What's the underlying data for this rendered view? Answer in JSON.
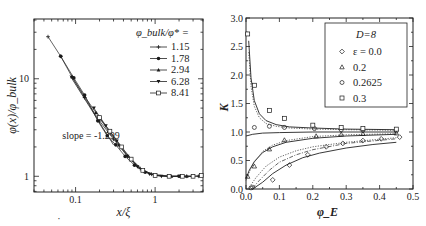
{
  "figure": {
    "background": "#ffffff",
    "ink": "#222222"
  },
  "chart_data": [
    {
      "id": "left",
      "type": "scatter",
      "scale": "log-log",
      "title": "",
      "xlabel": "x/ξ",
      "ylabel": "φ(x)/φ_bulk",
      "xlim": [
        0.03,
        4.0
      ],
      "ylim": [
        0.69,
        41
      ],
      "x_ticks": [
        {
          "value": 0.1,
          "label": "0.1"
        },
        {
          "value": 1,
          "label": "1"
        }
      ],
      "y_ticks": [
        {
          "value": 1,
          "label": "1"
        },
        {
          "value": 10,
          "label": "10"
        }
      ],
      "grid": false,
      "legend": {
        "title": "φ_bulk/φ* =",
        "position": "upper right",
        "entries": [
          {
            "label": "1.15",
            "marker": "plus"
          },
          {
            "label": "1.78",
            "marker": "filled-circle"
          },
          {
            "label": "2.94",
            "marker": "filled-triangle-up"
          },
          {
            "label": "6.28",
            "marker": "filled-triangle-down"
          },
          {
            "label": "8.41",
            "marker": "open-square"
          }
        ]
      },
      "annotation": {
        "text": "slope = -1.299",
        "x": 0.068,
        "y": 2.6
      },
      "reference_line": {
        "slope": -1.299,
        "x": [
          0.085,
          0.3
        ],
        "y": [
          10.8,
          2.1
        ]
      },
      "series": [
        {
          "name": "1.15",
          "marker": "plus",
          "x": [
            0.045,
            0.065,
            0.09,
            0.13,
            0.2,
            0.3,
            0.45,
            0.65,
            0.9,
            1.5,
            2.5,
            3.5
          ],
          "y": [
            27,
            17,
            10.5,
            6.4,
            3.7,
            2.4,
            1.6,
            1.2,
            1.05,
            1.0,
            1.0,
            1.0
          ]
        },
        {
          "name": "1.78",
          "marker": "filled-circle",
          "x": [
            0.065,
            0.095,
            0.13,
            0.19,
            0.25,
            0.32,
            0.42,
            0.55,
            0.75,
            1.0,
            1.5,
            2.0,
            3.0
          ],
          "y": [
            17.0,
            10.2,
            6.8,
            3.7,
            2.6,
            2.1,
            1.6,
            1.3,
            1.1,
            1.02,
            1.0,
            1.0,
            1.0
          ]
        },
        {
          "name": "2.94",
          "marker": "filled-triangle-up",
          "x": [
            0.09,
            0.13,
            0.18,
            0.26,
            0.35,
            0.5,
            0.7,
            1.0,
            1.6,
            2.5
          ],
          "y": [
            10.5,
            6.6,
            4.5,
            2.9,
            2.1,
            1.5,
            1.15,
            1.03,
            1.0,
            1.0
          ]
        },
        {
          "name": "6.28",
          "marker": "filled-triangle-down",
          "x": [
            0.17,
            0.24,
            0.33,
            0.45,
            0.6,
            0.85,
            1.2,
            2.0,
            3.0
          ],
          "y": [
            5.0,
            3.3,
            2.3,
            1.6,
            1.25,
            1.05,
            1.0,
            1.0,
            1.0
          ]
        },
        {
          "name": "8.41",
          "marker": "open-square",
          "x": [
            0.2,
            0.27,
            0.38,
            0.5,
            0.7,
            1.0,
            1.5,
            2.2,
            3.0,
            3.8
          ],
          "y": [
            4.0,
            2.9,
            2.0,
            1.5,
            1.15,
            1.02,
            1.0,
            1.0,
            1.0,
            1.02
          ]
        }
      ]
    },
    {
      "id": "right",
      "type": "scatter",
      "title": "",
      "xlabel": "φ_E",
      "ylabel": "K",
      "xlim": [
        0.0,
        0.5
      ],
      "ylim": [
        0.0,
        3.0
      ],
      "x_ticks": [
        0.0,
        0.1,
        0.2,
        0.3,
        0.4,
        0.5
      ],
      "x_tick_labels": [
        "0.0",
        "0.1",
        "0.2",
        "0.3",
        "0.4",
        "0.5"
      ],
      "y_ticks": [
        0.0,
        0.5,
        1.0,
        1.5,
        2.0,
        2.5,
        3.0
      ],
      "y_tick_labels": [
        "0.0",
        "0.5",
        "1.0",
        "1.5",
        "2.0",
        "2.5",
        "3.0"
      ],
      "grid": false,
      "legend": {
        "title": "D=8",
        "position": "upper right",
        "entries": [
          {
            "label": "ε = 0.0",
            "marker": "open-diamond"
          },
          {
            "label": "0.2",
            "marker": "open-triangle"
          },
          {
            "label": "0.2625",
            "marker": "open-circle"
          },
          {
            "label": "0.3",
            "marker": "open-square"
          }
        ]
      },
      "series": [
        {
          "name": "ε = 0.0",
          "marker": "open-diamond",
          "x": [
            0.02,
            0.08,
            0.13,
            0.185,
            0.24,
            0.29,
            0.35,
            0.405,
            0.46
          ],
          "y": [
            0.03,
            0.16,
            0.42,
            0.6,
            0.74,
            0.8,
            0.85,
            0.88,
            0.91
          ]
        },
        {
          "name": "0.2",
          "marker": "open-triangle",
          "x": [
            0.005,
            0.025,
            0.07,
            0.115,
            0.21,
            0.285,
            0.35,
            0.45
          ],
          "y": [
            0.22,
            0.4,
            0.7,
            0.86,
            0.93,
            0.96,
            0.97,
            0.98
          ]
        },
        {
          "name": "0.2625",
          "marker": "open-circle",
          "x": [
            0.015,
            0.025,
            0.07,
            0.115,
            0.205,
            0.285,
            0.35,
            0.45
          ],
          "y": [
            0.02,
            1.08,
            1.1,
            1.08,
            1.06,
            1.04,
            1.03,
            1.02
          ]
        },
        {
          "name": "0.3",
          "marker": "open-square",
          "x": [
            0.005,
            0.025,
            0.07,
            0.115,
            0.2,
            0.285,
            0.35,
            0.45
          ],
          "y": [
            2.72,
            1.82,
            1.38,
            1.24,
            1.12,
            1.08,
            1.06,
            1.05
          ]
        }
      ],
      "fit_curves": [
        {
          "name": "ε=0.3 solid",
          "style": "solid",
          "x": [
            0.008,
            0.015,
            0.025,
            0.04,
            0.06,
            0.09,
            0.13,
            0.2,
            0.3,
            0.45
          ],
          "y": [
            2.6,
            1.95,
            1.55,
            1.32,
            1.2,
            1.13,
            1.09,
            1.07,
            1.05,
            1.04
          ]
        },
        {
          "name": "ε=0.3 dotted",
          "style": "dotted",
          "x": [
            0.008,
            0.015,
            0.025,
            0.04,
            0.06,
            0.09,
            0.13,
            0.2,
            0.3,
            0.45
          ],
          "y": [
            2.4,
            1.8,
            1.45,
            1.25,
            1.15,
            1.1,
            1.07,
            1.05,
            1.04,
            1.03
          ]
        },
        {
          "name": "ε=0.2625 solid",
          "style": "solid",
          "x": [
            0.0,
            0.02,
            0.05,
            0.1,
            0.2,
            0.3,
            0.45
          ],
          "y": [
            0.93,
            0.96,
            0.98,
            0.99,
            1.0,
            1.0,
            1.0
          ]
        },
        {
          "name": "ε=0.2 solid",
          "style": "solid",
          "x": [
            0.0,
            0.01,
            0.025,
            0.05,
            0.08,
            0.12,
            0.2,
            0.3,
            0.45
          ],
          "y": [
            0.18,
            0.33,
            0.48,
            0.64,
            0.74,
            0.82,
            0.89,
            0.93,
            0.96
          ]
        },
        {
          "name": "ε=0.2 dotted",
          "style": "dotted",
          "x": [
            0.0,
            0.01,
            0.025,
            0.05,
            0.08,
            0.12,
            0.2,
            0.3,
            0.45
          ],
          "y": [
            0.15,
            0.3,
            0.47,
            0.66,
            0.77,
            0.85,
            0.92,
            0.95,
            0.97
          ]
        },
        {
          "name": "ε=0.0 dotted",
          "style": "dotted",
          "x": [
            0.01,
            0.03,
            0.06,
            0.1,
            0.15,
            0.2,
            0.3,
            0.45
          ],
          "y": [
            0.03,
            0.2,
            0.4,
            0.56,
            0.67,
            0.74,
            0.82,
            0.9
          ]
        },
        {
          "name": "ε=0.0 dashdot",
          "style": "dashdot",
          "x": [
            0.02,
            0.04,
            0.07,
            0.1,
            0.15,
            0.2,
            0.3,
            0.45
          ],
          "y": [
            0.02,
            0.15,
            0.33,
            0.47,
            0.6,
            0.69,
            0.8,
            0.88
          ]
        },
        {
          "name": "ε=0.0 solid",
          "style": "solid",
          "x": [
            0.02,
            0.05,
            0.08,
            0.12,
            0.17,
            0.22,
            0.3,
            0.38,
            0.45
          ],
          "y": [
            0.0,
            0.12,
            0.27,
            0.42,
            0.55,
            0.63,
            0.72,
            0.78,
            0.82
          ]
        }
      ]
    }
  ]
}
